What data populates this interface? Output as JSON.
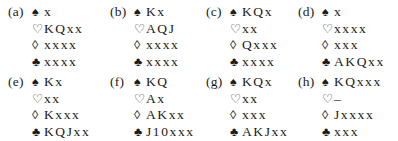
{
  "suit_symbols": {
    "spades": "♠",
    "hearts": "♡",
    "diamonds": "◊",
    "clubs": "♣"
  },
  "hands": [
    {
      "label": "(a)",
      "spades": "x",
      "hearts": "KQxx",
      "diamonds": "xxxx",
      "clubs": "xxxx"
    },
    {
      "label": "(b)",
      "spades": "Kx",
      "hearts": "AQJ",
      "diamonds": "xxxx",
      "clubs": "xxxx"
    },
    {
      "label": "(c)",
      "spades": "KQx",
      "hearts": "xx",
      "diamonds": "Qxxx",
      "clubs": "xxxx"
    },
    {
      "label": "(d)",
      "spades": "x",
      "hearts": "xxxx",
      "diamonds": "xxx",
      "clubs": "AKQxx"
    },
    {
      "label": "(e)",
      "spades": "Kx",
      "hearts": "xx",
      "diamonds": "Kxxx",
      "clubs": "KQJxx"
    },
    {
      "label": "(f)",
      "spades": "KQ",
      "hearts": "Ax",
      "diamonds": "AKxx",
      "clubs": "J10xxx"
    },
    {
      "label": "(g)",
      "spades": "KQx",
      "hearts": "xx",
      "diamonds": "xxx",
      "clubs": "AKJxx"
    },
    {
      "label": "(h)",
      "spades": "KQxxx",
      "hearts": "–",
      "diamonds": "Jxxxx",
      "clubs": "xxx"
    }
  ]
}
